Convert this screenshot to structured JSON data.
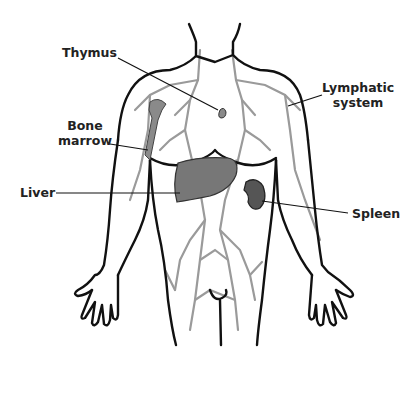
{
  "diagram": {
    "colors": {
      "outline": "#111111",
      "vessels": "#8f8f8f",
      "organs": "#6f6f6f",
      "spleen": "#555555",
      "label_text": "#222222",
      "background": "#ffffff"
    },
    "labels": [
      {
        "id": "thymus",
        "text": "Thymus"
      },
      {
        "id": "bone_marrow",
        "line1": "Bone",
        "line2": "marrow"
      },
      {
        "id": "liver",
        "text": "Liver"
      },
      {
        "id": "lymphatic_system",
        "line1": "Lymphatic",
        "line2": "system"
      },
      {
        "id": "spleen",
        "text": "Spleen"
      }
    ]
  }
}
